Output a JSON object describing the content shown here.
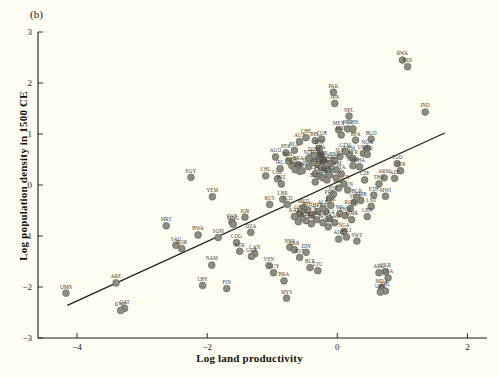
{
  "figure": {
    "panel_label": "(b)",
    "xlabel": "Log land productivity",
    "ylabel": "Log population density in 1500 CE",
    "background_color": "#fffef2",
    "point_color": "#8e8d80",
    "trend_color": "#1f1f1a"
  },
  "chart_data": {
    "type": "scatter",
    "title": "",
    "xlabel": "Log land productivity",
    "ylabel": "Log population density in 1500 CE",
    "xlim": [
      -4.6,
      2.3
    ],
    "ylim": [
      -3.0,
      3.0
    ],
    "xticks": [
      -4,
      -2,
      0,
      2
    ],
    "yticks": [
      -3,
      -2,
      -1,
      0,
      1,
      2,
      3
    ],
    "grid": false,
    "legend": "none",
    "trend_line": {
      "x": [
        -4.15,
        1.65
      ],
      "y": [
        -2.36,
        1.02
      ]
    },
    "points": [
      {
        "label": "OMN",
        "x": -4.17,
        "y": -2.12
      },
      {
        "label": "ARE",
        "x": -3.4,
        "y": -1.92
      },
      {
        "label": "QAT",
        "x": -3.27,
        "y": -2.42
      },
      {
        "label": "KWT",
        "x": -3.33,
        "y": -2.46
      },
      {
        "label": "MRT",
        "x": -2.63,
        "y": -0.8
      },
      {
        "label": "SAU",
        "x": -2.48,
        "y": -1.18
      },
      {
        "label": "NOR",
        "x": -2.39,
        "y": -1.25
      },
      {
        "label": "EGY",
        "x": -2.25,
        "y": 0.15
      },
      {
        "label": "BWA",
        "x": -2.14,
        "y": -0.98
      },
      {
        "label": "LBY",
        "x": -2.07,
        "y": -1.97
      },
      {
        "label": "YEM",
        "x": -1.92,
        "y": -0.23
      },
      {
        "label": "NAM",
        "x": -1.93,
        "y": -1.57
      },
      {
        "label": "SOM",
        "x": -1.83,
        "y": -1.03
      },
      {
        "label": "FIN",
        "x": -1.7,
        "y": -2.03
      },
      {
        "label": "SWE",
        "x": -1.62,
        "y": -0.73
      },
      {
        "label": "MNG",
        "x": -1.6,
        "y": -0.77
      },
      {
        "label": "COG",
        "x": -1.55,
        "y": -1.13
      },
      {
        "label": "SUR",
        "x": -1.5,
        "y": -1.3
      },
      {
        "label": "JOR",
        "x": -1.42,
        "y": -0.63
      },
      {
        "label": "DZA",
        "x": -1.33,
        "y": -0.93
      },
      {
        "label": "CAN",
        "x": -1.27,
        "y": -1.35
      },
      {
        "label": "GAB",
        "x": -1.32,
        "y": -1.4
      },
      {
        "label": "CHL",
        "x": -1.1,
        "y": 0.18
      },
      {
        "label": "RUS",
        "x": -1.04,
        "y": -0.38
      },
      {
        "label": "VEN",
        "x": -1.05,
        "y": -1.58
      },
      {
        "label": "GUY",
        "x": -0.98,
        "y": -1.72
      },
      {
        "label": "MYS",
        "x": -0.78,
        "y": -2.22
      },
      {
        "label": "BRA",
        "x": -0.82,
        "y": -1.88
      },
      {
        "label": "COL",
        "x": -0.92,
        "y": 0.12
      },
      {
        "label": "BIZ",
        "x": -0.86,
        "y": 0.02
      },
      {
        "label": "IRL",
        "x": -0.88,
        "y": 0.32
      },
      {
        "label": "LBR",
        "x": -0.84,
        "y": -0.28
      },
      {
        "label": "TCD",
        "x": -0.77,
        "y": -0.38
      },
      {
        "label": "NER",
        "x": -0.73,
        "y": -1.22
      },
      {
        "label": "ZAR",
        "x": -0.66,
        "y": -1.27
      },
      {
        "label": "EST",
        "x": -0.58,
        "y": -1.42
      },
      {
        "label": "IDN",
        "x": -0.48,
        "y": -1.32
      },
      {
        "label": "BLR",
        "x": -0.42,
        "y": -1.62
      },
      {
        "label": "LTU",
        "x": -0.3,
        "y": -1.68
      },
      {
        "label": "AGO",
        "x": -0.95,
        "y": 0.55
      },
      {
        "label": "PER",
        "x": -0.79,
        "y": 0.63
      },
      {
        "label": "BOL",
        "x": -0.75,
        "y": 0.47
      },
      {
        "label": "NLD",
        "x": -0.66,
        "y": 0.68
      },
      {
        "label": "AUT",
        "x": -0.58,
        "y": 0.85
      },
      {
        "label": "CHE",
        "x": -0.48,
        "y": 0.93
      },
      {
        "label": "GBR",
        "x": -0.7,
        "y": 0.38
      },
      {
        "label": "FRA",
        "x": -0.65,
        "y": 0.3
      },
      {
        "label": "BRA2",
        "x": -0.6,
        "y": 0.4
      },
      {
        "label": "ZAF",
        "x": -0.58,
        "y": 0.27
      },
      {
        "label": "MOZ",
        "x": -0.54,
        "y": 0.28
      },
      {
        "label": "BEL",
        "x": -0.34,
        "y": 0.87
      },
      {
        "label": "CUB",
        "x": -0.24,
        "y": 0.9
      },
      {
        "label": "HTI",
        "x": -0.28,
        "y": 0.72
      },
      {
        "label": "TZA",
        "x": -0.26,
        "y": 0.62
      },
      {
        "label": "DZA2",
        "x": -0.33,
        "y": 0.52
      },
      {
        "label": "CMR",
        "x": -0.28,
        "y": 0.48
      },
      {
        "label": "GIN",
        "x": -0.22,
        "y": 0.5
      },
      {
        "label": "MLI",
        "x": -0.2,
        "y": 0.44
      },
      {
        "label": "SEN",
        "x": -0.3,
        "y": 0.4
      },
      {
        "label": "GHA",
        "x": -0.24,
        "y": 0.35
      },
      {
        "label": "BEN",
        "x": -0.18,
        "y": 0.33
      },
      {
        "label": "PRY",
        "x": -0.14,
        "y": 0.28
      },
      {
        "label": "CIV",
        "x": -0.34,
        "y": 0.22
      },
      {
        "label": "KEN",
        "x": -0.28,
        "y": 0.18
      },
      {
        "label": "SDN",
        "x": -0.22,
        "y": 0.14
      },
      {
        "label": "UGA",
        "x": -0.16,
        "y": 0.1
      },
      {
        "label": "MEX",
        "x": 0.02,
        "y": 1.08
      },
      {
        "label": "KOR",
        "x": 0.06,
        "y": 0.98
      },
      {
        "label": "PRK",
        "x": 0.16,
        "y": 1.1
      },
      {
        "label": "CHN",
        "x": 0.24,
        "y": 1.1
      },
      {
        "label": "NPL",
        "x": 0.18,
        "y": 1.35
      },
      {
        "label": "JPN",
        "x": -0.04,
        "y": 1.6
      },
      {
        "label": "PAK",
        "x": -0.06,
        "y": 1.82
      },
      {
        "label": "BFA",
        "x": 0.28,
        "y": 0.88
      },
      {
        "label": "BGD",
        "x": 0.52,
        "y": 0.9
      },
      {
        "label": "NGA",
        "x": 0.46,
        "y": 0.72
      },
      {
        "label": "KHM",
        "x": 0.18,
        "y": 0.6
      },
      {
        "label": "SYR",
        "x": 0.24,
        "y": 0.52
      },
      {
        "label": "UGA2",
        "x": 0.4,
        "y": 0.62
      },
      {
        "label": "TCD2",
        "x": 0.46,
        "y": 0.6
      },
      {
        "label": "MAR",
        "x": 0.24,
        "y": 0.38
      },
      {
        "label": "GHA2",
        "x": 0.34,
        "y": 0.36
      },
      {
        "label": "IND",
        "x": 1.35,
        "y": 1.43
      },
      {
        "label": "RWA",
        "x": 1.0,
        "y": 2.45
      },
      {
        "label": "BDI",
        "x": 1.08,
        "y": 2.32
      },
      {
        "label": "TGO",
        "x": 0.92,
        "y": 0.42
      },
      {
        "label": "TUR",
        "x": 0.97,
        "y": 0.28
      },
      {
        "label": "ARM",
        "x": 0.72,
        "y": 0.14
      },
      {
        "label": "AZE",
        "x": 0.88,
        "y": 0.13
      },
      {
        "label": "THA",
        "x": 0.64,
        "y": 0.02
      },
      {
        "label": "MWI",
        "x": 0.74,
        "y": -0.22
      },
      {
        "label": "ETH",
        "x": 0.56,
        "y": -0.2
      },
      {
        "label": "LSO",
        "x": 0.52,
        "y": -0.42
      },
      {
        "label": "LBN",
        "x": 0.46,
        "y": -0.62
      },
      {
        "label": "SWZ",
        "x": 0.3,
        "y": -1.1
      },
      {
        "label": "ARG",
        "x": 0.64,
        "y": -1.72
      },
      {
        "label": "UKR",
        "x": 0.74,
        "y": -1.7
      },
      {
        "label": "USA",
        "x": 0.78,
        "y": -1.82
      },
      {
        "label": "MDA",
        "x": 0.68,
        "y": -2.02
      },
      {
        "label": "PHL",
        "x": 0.74,
        "y": -2.08
      },
      {
        "label": "URY",
        "x": 0.66,
        "y": -2.1
      },
      {
        "label": "NGA2",
        "x": 0.1,
        "y": -0.92
      },
      {
        "label": "AUS",
        "x": 0.02,
        "y": -1.06
      },
      {
        "label": "MLI2",
        "x": 0.14,
        "y": -1.02
      },
      {
        "label": "LVA",
        "x": -0.18,
        "y": -0.52
      },
      {
        "label": "GMB",
        "x": 0.36,
        "y": -0.3
      },
      {
        "label": "SLE",
        "x": 0.26,
        "y": -0.34
      },
      {
        "label": "ROM",
        "x": 0.2,
        "y": -0.46
      },
      {
        "label": "NIC",
        "x": 0.04,
        "y": -0.56
      },
      {
        "label": "BGR",
        "x": 0.3,
        "y": -0.24
      },
      {
        "label": "TUN",
        "x": 0.16,
        "y": -0.1
      },
      {
        "label": "CZE",
        "x": 0.42,
        "y": 0.1
      },
      {
        "label": "HUN",
        "x": 0.1,
        "y": 0.02
      },
      {
        "label": "POL",
        "x": 0.02,
        "y": -0.06
      },
      {
        "label": "ESP",
        "x": -0.06,
        "y": -0.18
      },
      {
        "label": "PRT",
        "x": -0.12,
        "y": -0.26
      },
      {
        "label": "ITA",
        "x": 0.06,
        "y": 0.22
      },
      {
        "label": "GRC",
        "x": -0.02,
        "y": 0.14
      },
      {
        "label": "DEU",
        "x": -0.38,
        "y": 0.44
      },
      {
        "label": "DNK",
        "x": -0.44,
        "y": 0.36
      },
      {
        "label": "SVK",
        "x": -0.1,
        "y": -0.4
      },
      {
        "label": "ALB",
        "x": -0.22,
        "y": -0.46
      },
      {
        "label": "HRV",
        "x": -0.3,
        "y": -0.52
      },
      {
        "label": "SVN",
        "x": -0.4,
        "y": -0.58
      },
      {
        "label": "BIH",
        "x": -0.46,
        "y": -0.5
      },
      {
        "label": "MKD",
        "x": -0.52,
        "y": -0.44
      },
      {
        "label": "GEO",
        "x": -0.58,
        "y": -0.56
      },
      {
        "label": "LKA",
        "x": -0.12,
        "y": -0.66
      },
      {
        "label": "VNM",
        "x": 0.12,
        "y": -0.6
      },
      {
        "label": "MMR",
        "x": 0.22,
        "y": -0.68
      },
      {
        "label": "LAO",
        "x": -0.04,
        "y": -0.74
      },
      {
        "label": "AFG",
        "x": -0.14,
        "y": -0.82
      },
      {
        "label": "IRN",
        "x": -0.22,
        "y": -0.74
      },
      {
        "label": "IRQ",
        "x": -0.32,
        "y": -0.68
      },
      {
        "label": "TJK",
        "x": -0.4,
        "y": -0.76
      },
      {
        "label": "UZB",
        "x": -0.48,
        "y": -0.7
      },
      {
        "label": "KGZ",
        "x": -0.54,
        "y": -0.64
      },
      {
        "label": "TKM",
        "x": -0.6,
        "y": -0.72
      },
      {
        "label": "KAZ",
        "x": -0.66,
        "y": -0.62
      },
      {
        "label": "ECU",
        "x": -0.34,
        "y": 0.06
      },
      {
        "label": "GTM",
        "x": 0.12,
        "y": 0.66
      },
      {
        "label": "SLV",
        "x": 0.04,
        "y": 0.56
      },
      {
        "label": "HND",
        "x": -0.04,
        "y": 0.48
      },
      {
        "label": "CRI",
        "x": -0.1,
        "y": 0.42
      },
      {
        "label": "PAN",
        "x": -0.16,
        "y": 0.38
      },
      {
        "label": "JAM",
        "x": -0.02,
        "y": 0.3
      },
      {
        "label": "DOM",
        "x": -0.36,
        "y": 0.58
      },
      {
        "label": "NZL",
        "x": -0.44,
        "y": 0.52
      },
      {
        "label": "PNG",
        "x": -0.12,
        "y": 0.2
      }
    ]
  }
}
